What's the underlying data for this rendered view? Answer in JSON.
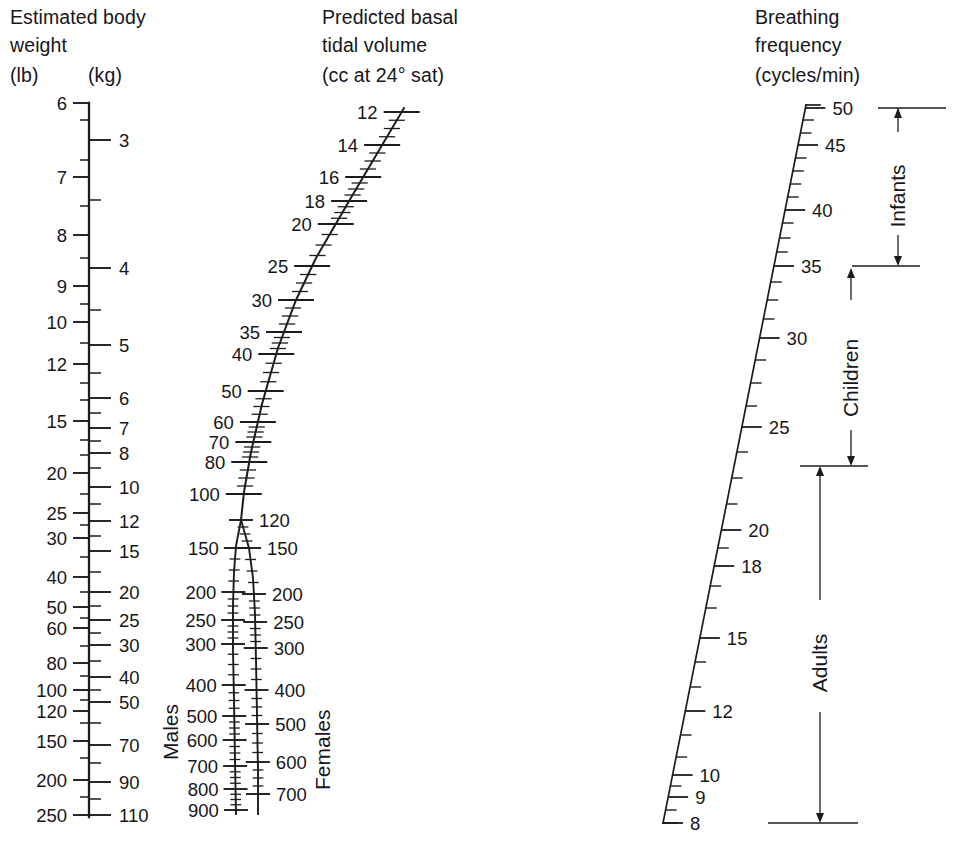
{
  "figure": {
    "type": "nomogram",
    "background_color": "#ffffff",
    "ink_color": "#1d1b1f"
  },
  "scales": {
    "weight": {
      "title_line1": "Estimated body",
      "title_line2": "weight",
      "unit_left": "(lb)",
      "unit_right": "(kg)",
      "left_ticks": [
        {
          "label": "6",
          "y": 103
        },
        {
          "label": "7",
          "y": 177
        },
        {
          "label": "8",
          "y": 235
        },
        {
          "label": "9",
          "y": 286
        },
        {
          "label": "10",
          "y": 322
        },
        {
          "label": "12",
          "y": 364
        },
        {
          "label": "15",
          "y": 421
        },
        {
          "label": "20",
          "y": 473
        },
        {
          "label": "25",
          "y": 513
        },
        {
          "label": "30",
          "y": 538
        },
        {
          "label": "40",
          "y": 577
        },
        {
          "label": "50",
          "y": 607
        },
        {
          "label": "60",
          "y": 628
        },
        {
          "label": "80",
          "y": 663
        },
        {
          "label": "100",
          "y": 690
        },
        {
          "label": "120",
          "y": 711
        },
        {
          "label": "150",
          "y": 741
        },
        {
          "label": "200",
          "y": 780
        },
        {
          "label": "250",
          "y": 815
        }
      ],
      "right_ticks": [
        {
          "label": "3",
          "y": 140
        },
        {
          "label": "4",
          "y": 268
        },
        {
          "label": "5",
          "y": 345
        },
        {
          "label": "6",
          "y": 398
        },
        {
          "label": "7",
          "y": 428
        },
        {
          "label": "8",
          "y": 453
        },
        {
          "label": "10",
          "y": 487
        },
        {
          "label": "12",
          "y": 521
        },
        {
          "label": "15",
          "y": 551
        },
        {
          "label": "20",
          "y": 592
        },
        {
          "label": "25",
          "y": 620
        },
        {
          "label": "30",
          "y": 645
        },
        {
          "label": "40",
          "y": 677
        },
        {
          "label": "50",
          "y": 702
        },
        {
          "label": "70",
          "y": 745
        },
        {
          "label": "90",
          "y": 782
        },
        {
          "label": "110",
          "y": 815
        }
      ],
      "minor_ticks_left": [
        120,
        160,
        206,
        258,
        304,
        343,
        383,
        400,
        440,
        455,
        494,
        525,
        557,
        592,
        618,
        646,
        676,
        700,
        723,
        758,
        797
      ],
      "minor_ticks_right": [
        200,
        310,
        373,
        413,
        441,
        468,
        504,
        536,
        572,
        606,
        633,
        661,
        690,
        723,
        763,
        799
      ]
    },
    "tidal_volume": {
      "title_line1": "Predicted basal",
      "title_line2": "tidal volume",
      "title_line3": "(cc at 24° sat)",
      "main_ticks": [
        {
          "label": "12",
          "y": 112
        },
        {
          "label": "14",
          "y": 145
        },
        {
          "label": "16",
          "y": 177
        },
        {
          "label": "18",
          "y": 201
        },
        {
          "label": "20",
          "y": 224
        },
        {
          "label": "25",
          "y": 266
        },
        {
          "label": "30",
          "y": 300
        },
        {
          "label": "35",
          "y": 332
        },
        {
          "label": "40",
          "y": 354
        },
        {
          "label": "50",
          "y": 391
        },
        {
          "label": "60",
          "y": 422
        },
        {
          "label": "70",
          "y": 442
        },
        {
          "label": "80",
          "y": 462
        },
        {
          "label": "100",
          "y": 494
        }
      ],
      "branch_males_label": "Males",
      "branch_females_label": "Females",
      "males_ticks": [
        {
          "label": "150",
          "y": 548
        },
        {
          "label": "200",
          "y": 592
        },
        {
          "label": "250",
          "y": 620
        },
        {
          "label": "300",
          "y": 644
        },
        {
          "label": "400",
          "y": 685
        },
        {
          "label": "500",
          "y": 716
        },
        {
          "label": "600",
          "y": 740
        },
        {
          "label": "700",
          "y": 766
        },
        {
          "label": "800",
          "y": 789
        },
        {
          "label": "900",
          "y": 810
        }
      ],
      "females_ticks": [
        {
          "label": "120",
          "y": 520
        },
        {
          "label": "150",
          "y": 548
        },
        {
          "label": "200",
          "y": 594
        },
        {
          "label": "250",
          "y": 622
        },
        {
          "label": "300",
          "y": 648
        },
        {
          "label": "400",
          "y": 690
        },
        {
          "label": "500",
          "y": 724
        },
        {
          "label": "600",
          "y": 762
        },
        {
          "label": "700",
          "y": 794
        }
      ]
    },
    "breathing_frequency": {
      "title_line1": "Breathing",
      "title_line2": "frequency",
      "title_line3": "(cycles/min)",
      "ticks": [
        {
          "label": "50",
          "y": 108
        },
        {
          "label": "45",
          "y": 145
        },
        {
          "label": "40",
          "y": 210
        },
        {
          "label": "35",
          "y": 266
        },
        {
          "label": "30",
          "y": 338
        },
        {
          "label": "25",
          "y": 427
        },
        {
          "label": "20",
          "y": 530
        },
        {
          "label": "18",
          "y": 566
        },
        {
          "label": "15",
          "y": 638
        },
        {
          "label": "12",
          "y": 711
        },
        {
          "label": "10",
          "y": 775
        },
        {
          "label": "9",
          "y": 797
        },
        {
          "label": "8",
          "y": 823
        }
      ],
      "minor_ticks": [
        120,
        133,
        158,
        171,
        184,
        197,
        223,
        238,
        252,
        282,
        300,
        319,
        360,
        383,
        406,
        452,
        478,
        504,
        548,
        586,
        608,
        662,
        687,
        735,
        757,
        786,
        810
      ]
    }
  },
  "ranges": [
    {
      "label": "Infants",
      "from_value": "50",
      "to_value": "30",
      "top_y": 108,
      "bottom_y": 266
    },
    {
      "label": "Children",
      "from_value": "30",
      "to_value": "18",
      "top_y": 266,
      "bottom_y": 466
    },
    {
      "label": "Adults",
      "from_value": "18",
      "to_value": "8",
      "top_y": 466,
      "bottom_y": 823
    }
  ],
  "chart_data": {
    "type": "line",
    "axes": [
      {
        "name": "Estimated body weight",
        "units": [
          "lb",
          "kg"
        ],
        "lb_values": [
          6,
          7,
          8,
          9,
          10,
          12,
          15,
          20,
          25,
          30,
          40,
          50,
          60,
          80,
          100,
          120,
          150,
          200,
          250
        ],
        "kg_values": [
          3,
          4,
          5,
          6,
          7,
          8,
          10,
          12,
          15,
          20,
          25,
          30,
          40,
          50,
          70,
          90,
          110
        ],
        "scale": "logarithmic"
      },
      {
        "name": "Predicted basal tidal volume",
        "units": "cc at 24° sat",
        "values": [
          12,
          14,
          16,
          18,
          20,
          25,
          30,
          35,
          40,
          50,
          60,
          70,
          80,
          100
        ],
        "branch_males": [
          150,
          200,
          250,
          300,
          400,
          500,
          600,
          700,
          800,
          900
        ],
        "branch_females": [
          120,
          150,
          200,
          250,
          300,
          400,
          500,
          600,
          700
        ],
        "scale": "logarithmic"
      },
      {
        "name": "Breathing frequency",
        "units": "cycles/min",
        "values": [
          50,
          45,
          40,
          35,
          30,
          25,
          20,
          18,
          15,
          12,
          10,
          9,
          8
        ],
        "scale": "logarithmic",
        "direction": "descending",
        "bands": [
          {
            "label": "Infants",
            "range": [
              30,
              50
            ]
          },
          {
            "label": "Children",
            "range": [
              18,
              30
            ]
          },
          {
            "label": "Adults",
            "range": [
              8,
              18
            ]
          }
        ]
      }
    ]
  }
}
